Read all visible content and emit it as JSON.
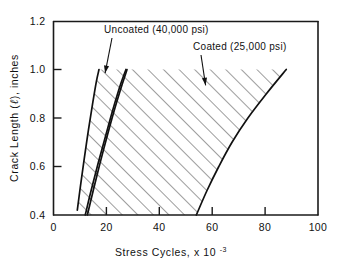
{
  "chart_data": {
    "type": "line",
    "title": "",
    "xlabel": "Stress Cycles, x 10",
    "xlabel_exponent": "-3",
    "ylabel_prefix": "Crack Length (",
    "ylabel_symbol": "ℓ",
    "ylabel_suffix": "), inches",
    "xlim": [
      0,
      100
    ],
    "ylim": [
      0.4,
      1.2
    ],
    "xticks": [
      0,
      20,
      40,
      60,
      80,
      100
    ],
    "xtick_labels": [
      "0",
      "20",
      "40",
      "60",
      "80",
      "100"
    ],
    "yticks": [
      0.4,
      0.6,
      0.8,
      1.0,
      1.2
    ],
    "ytick_labels": [
      "0.4",
      "0.6",
      "0.8",
      "1.0",
      "1.2"
    ],
    "grid": false,
    "legend_position": "inside-annotations",
    "annotations": [
      {
        "id": "uncoated",
        "text": "Uncoated (40,000 psi)",
        "label_x": 31,
        "label_y": 1.18,
        "point_x": 19.5,
        "point_y": 0.985
      },
      {
        "id": "coated",
        "text": "Coated (25,000 psi)",
        "label_x": 66,
        "label_y": 1.115,
        "point_x": 57.5,
        "point_y": 0.935
      }
    ],
    "series": [
      {
        "name": "Uncoated (40,000 psi) lower bound",
        "band": "uncoated",
        "edge": "left",
        "x": [
          9.0,
          10.2,
          11.6,
          13.2,
          14.8,
          16.2,
          17.2
        ],
        "y": [
          0.42,
          0.52,
          0.63,
          0.75,
          0.86,
          0.95,
          1.0
        ]
      },
      {
        "name": "Uncoated (40,000 psi) upper bound",
        "band": "uncoated",
        "edge": "right",
        "x": [
          12.8,
          15.0,
          17.5,
          20.4,
          23.2,
          26.0,
          27.8
        ],
        "y": [
          0.4,
          0.5,
          0.61,
          0.73,
          0.84,
          0.94,
          1.0
        ]
      },
      {
        "name": "Coated (25,000 psi) lower bound",
        "band": "coated",
        "edge": "left",
        "x": [
          12.0,
          14.2,
          16.8,
          19.8,
          22.6,
          25.4,
          27.4
        ],
        "y": [
          0.4,
          0.5,
          0.61,
          0.73,
          0.84,
          0.94,
          1.0
        ]
      },
      {
        "name": "Coated (25,000 psi) upper bound",
        "band": "coated",
        "edge": "right",
        "x": [
          54.0,
          58.0,
          62.5,
          67.5,
          73.5,
          80.5,
          88.0
        ],
        "y": [
          0.4,
          0.5,
          0.6,
          0.7,
          0.8,
          0.9,
          1.0
        ]
      }
    ],
    "bands": [
      {
        "name": "Uncoated (40,000 psi)",
        "fill": "diagonal-hatch",
        "hatch_direction": "up-right"
      },
      {
        "name": "Coated (25,000 psi)",
        "fill": "diagonal-hatch",
        "hatch_direction": "up-right"
      }
    ],
    "colors": {
      "ink": "#111111",
      "background": "#ffffff"
    }
  }
}
